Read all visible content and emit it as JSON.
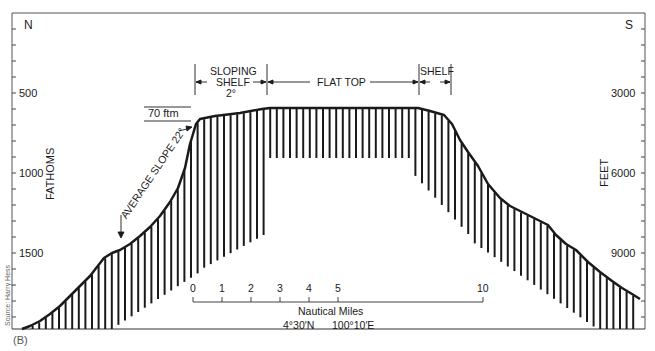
{
  "figure": {
    "panel_label": "(B)",
    "source": "Source: Harry Hess",
    "compass": {
      "left": "N",
      "right": "S"
    },
    "left_axis": {
      "title": "FATHOMS",
      "ticks": [
        {
          "value": "500",
          "y": 93
        },
        {
          "value": "1000",
          "y": 173
        },
        {
          "value": "1500",
          "y": 253
        }
      ]
    },
    "right_axis": {
      "title": "FEET",
      "ticks": [
        {
          "value": "3000",
          "y": 93
        },
        {
          "value": "6000",
          "y": 173
        },
        {
          "value": "9000",
          "y": 253
        }
      ]
    },
    "annotations": {
      "sloping_shelf_line1": "SLOPING",
      "sloping_shelf_line2": "SHELF",
      "sloping_shelf_angle": "2°",
      "flat_top": "FLAT TOP",
      "shelf": "SHELF",
      "relief": "70 ftm",
      "average_slope": "AVERAGE SLOPE 22°"
    },
    "scale_bar": {
      "ticks": [
        "0",
        "1",
        "2",
        "3",
        "4",
        "5",
        "10"
      ],
      "unit_label": "Nautical Miles",
      "latitude": "4°30′N",
      "longitude": "100°10′E"
    },
    "colors": {
      "ink": "#1a1a1a",
      "frame": "#555555",
      "background": "#ffffff"
    }
  }
}
